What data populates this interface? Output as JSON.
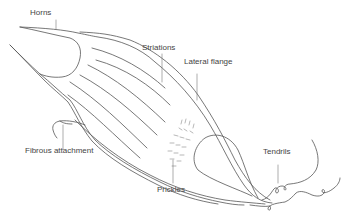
{
  "diagram": {
    "labels": {
      "horns": "Horns",
      "striations": "Striations",
      "lateral_flange": "Lateral flange",
      "fibrous_attachment": "Fibrous attachment",
      "prickles": "Prickles",
      "tendrils": "Tendrils"
    },
    "colors": {
      "line": "#555555",
      "text": "#444444",
      "background": "#ffffff"
    }
  }
}
